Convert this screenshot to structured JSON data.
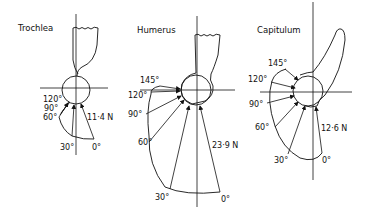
{
  "panels": [
    {
      "title": "Trochlea",
      "angles": [
        "120°",
        "90°",
        "60°",
        "30°",
        "0°"
      ],
      "max_force": "11·4 N"
    },
    {
      "title": "Humerus",
      "angles": [
        "145°",
        "120°",
        "90°",
        "60°",
        "30°",
        "0°"
      ],
      "max_force": "23·9 N"
    },
    {
      "title": "Capitulum",
      "angles": [
        "145°",
        "120°",
        "90°",
        "60°",
        "30°",
        "0°"
      ],
      "max_force": "12·6 N"
    }
  ],
  "colors": {
    "ink": "#111111",
    "background": "#ffffff"
  }
}
